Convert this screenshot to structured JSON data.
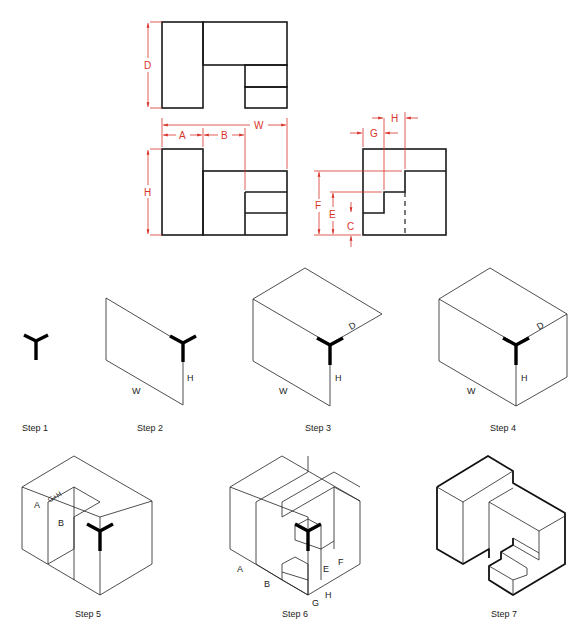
{
  "orthographic": {
    "top_view": {
      "dimension_labels": [
        "D"
      ]
    },
    "front_view": {
      "dimension_labels": [
        "A",
        "B",
        "W",
        "H"
      ]
    },
    "side_view": {
      "dimension_labels": [
        "G",
        "H",
        "F",
        "E",
        "C"
      ]
    }
  },
  "dims": {
    "D": "D",
    "A": "A",
    "B": "B",
    "W": "W",
    "H": "H",
    "G": "G",
    "H2": "H",
    "F": "F",
    "E": "E",
    "C": "C"
  },
  "steps": [
    {
      "label": "Step 1"
    },
    {
      "label": "Step 2",
      "labels": {
        "W": "W",
        "H": "H"
      }
    },
    {
      "label": "Step 3",
      "labels": {
        "W": "W",
        "H": "H",
        "D": "D"
      }
    },
    {
      "label": "Step 4",
      "labels": {
        "W": "W",
        "H": "H",
        "D": "D"
      }
    },
    {
      "label": "Step 5",
      "labels": {
        "A": "A",
        "B": "B",
        "GH": "G+H"
      }
    },
    {
      "label": "Step 6",
      "labels": {
        "A": "A",
        "B": "B",
        "E": "E",
        "F": "F",
        "G": "G",
        "H": "H"
      }
    },
    {
      "label": "Step 7"
    }
  ],
  "colors": {
    "dimension": "#d9342b",
    "object": "#1a1a1a"
  }
}
